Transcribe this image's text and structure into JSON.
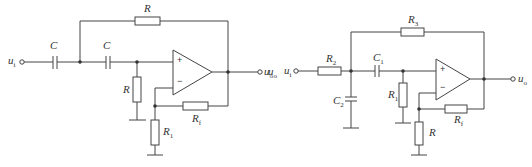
{
  "diagram": {
    "type": "circuit",
    "circuits": [
      {
        "id": "left",
        "labels": {
          "input": {
            "main": "u",
            "sub": "i"
          },
          "output": {
            "main": "u",
            "sub": "o"
          },
          "c_series_1": {
            "main": "C",
            "sub": ""
          },
          "c_series_2": {
            "main": "C",
            "sub": ""
          },
          "r_feedback_top": {
            "main": "R",
            "sub": ""
          },
          "r_shunt": {
            "main": "R",
            "sub": ""
          },
          "r_f": {
            "main": "R",
            "sub": "f"
          },
          "r_1": {
            "main": "R",
            "sub": "1"
          },
          "opamp_plus": "+",
          "opamp_minus": "−"
        }
      },
      {
        "id": "right",
        "labels": {
          "stray": {
            "main": "u",
            "sub": "o"
          },
          "input": {
            "main": "u",
            "sub": "i"
          },
          "output": {
            "main": "u",
            "sub": "o"
          },
          "r_2": {
            "main": "R",
            "sub": "2"
          },
          "r_3": {
            "main": "R",
            "sub": "3"
          },
          "c_1": {
            "main": "C",
            "sub": "1"
          },
          "c_2": {
            "main": "C",
            "sub": "2"
          },
          "r_1": {
            "main": "R",
            "sub": "1"
          },
          "r_f": {
            "main": "R",
            "sub": "f"
          },
          "r": {
            "main": "R",
            "sub": ""
          },
          "opamp_plus": "+",
          "opamp_minus": "−"
        }
      }
    ],
    "colors": {
      "line": "#444444",
      "background": "#ffffff"
    }
  }
}
